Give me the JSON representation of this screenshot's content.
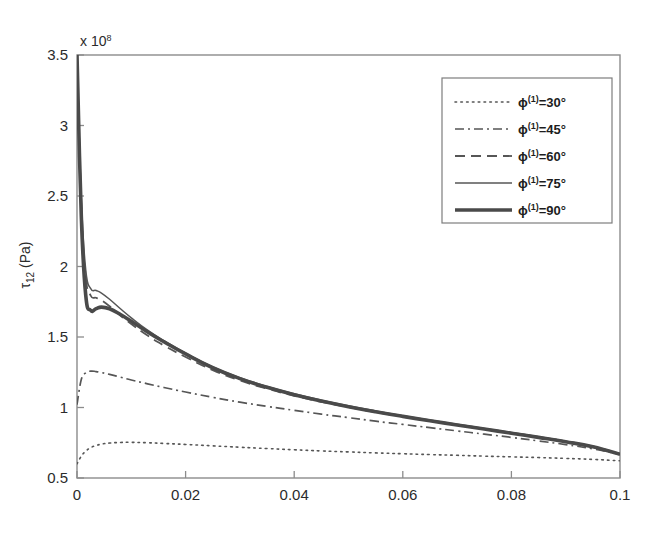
{
  "figure": {
    "exponent_label": "x 10",
    "exponent_value": "8",
    "y_axis_label_main": "τ",
    "y_axis_label_sub": "12",
    "y_axis_label_unit": " (Pa)"
  },
  "legend": {
    "position": "top-right",
    "entries": [
      {
        "label_sym": "ϕ",
        "label_sup": "(1)",
        "label_rest": "=30°",
        "style": "dotted",
        "angle": 30
      },
      {
        "label_sym": "ϕ",
        "label_sup": "(1)",
        "label_rest": "=45°",
        "style": "dash-dot",
        "angle": 45
      },
      {
        "label_sym": "ϕ",
        "label_sup": "(1)",
        "label_rest": "=60°",
        "style": "dashed",
        "angle": 60
      },
      {
        "label_sym": "ϕ",
        "label_sup": "(1)",
        "label_rest": "=75°",
        "style": "solid-thin",
        "angle": 75
      },
      {
        "label_sym": "ϕ",
        "label_sup": "(1)",
        "label_rest": "=90°",
        "style": "solid-thick",
        "angle": 90
      }
    ]
  },
  "chart_data": {
    "type": "line",
    "title": "",
    "xlabel": "",
    "ylabel": "τ_12 (Pa)",
    "y_exponent": 8,
    "y_exponent_text": "x 10^8",
    "xlim": [
      0,
      0.1
    ],
    "ylim": [
      0.5,
      3.5
    ],
    "xticks": [
      0,
      0.02,
      0.04,
      0.06,
      0.08,
      0.1
    ],
    "xtick_labels": [
      "0",
      "0.02",
      "0.04",
      "0.06",
      "0.08",
      "0.1"
    ],
    "yticks": [
      0.5,
      1,
      1.5,
      2,
      2.5,
      3,
      3.5
    ],
    "ytick_labels": [
      "0.5",
      "1",
      "1.5",
      "2",
      "2.5",
      "3",
      "3.5"
    ],
    "grid": false,
    "legend_position": "upper right",
    "x": [
      0,
      0.0008,
      0.0016,
      0.0025,
      0.0035,
      0.0045,
      0.006,
      0.008,
      0.01,
      0.013,
      0.016,
      0.02,
      0.025,
      0.03,
      0.035,
      0.04,
      0.045,
      0.05,
      0.055,
      0.06,
      0.065,
      0.07,
      0.075,
      0.08,
      0.085,
      0.09,
      0.095,
      0.1
    ],
    "series": [
      {
        "name": "ϕ(1)=30°",
        "style": "dotted",
        "values": [
          0.6,
          0.655,
          0.69,
          0.715,
          0.73,
          0.74,
          0.748,
          0.752,
          0.753,
          0.75,
          0.745,
          0.738,
          0.728,
          0.718,
          0.709,
          0.7,
          0.692,
          0.685,
          0.678,
          0.672,
          0.666,
          0.661,
          0.655,
          0.65,
          0.645,
          0.639,
          0.632,
          0.622
        ]
      },
      {
        "name": "ϕ(1)=45°",
        "style": "dash-dot",
        "values": [
          1.02,
          1.2,
          1.245,
          1.258,
          1.255,
          1.248,
          1.235,
          1.215,
          1.195,
          1.168,
          1.142,
          1.11,
          1.072,
          1.038,
          1.008,
          0.98,
          0.953,
          0.928,
          0.903,
          0.88,
          0.857,
          0.834,
          0.811,
          0.788,
          0.763,
          0.737,
          0.707,
          0.668
        ]
      },
      {
        "name": "ϕ(1)=60°",
        "style": "dashed",
        "values": [
          3.5,
          2.42,
          1.93,
          1.795,
          1.778,
          1.76,
          1.718,
          1.652,
          1.592,
          1.51,
          1.44,
          1.358,
          1.265,
          1.192,
          1.133,
          1.083,
          1.04,
          1.002,
          0.967,
          0.935,
          0.905,
          0.876,
          0.848,
          0.82,
          0.791,
          0.76,
          0.724,
          0.672
        ]
      },
      {
        "name": "ϕ(1)=75°",
        "style": "solid-thin",
        "values": [
          3.5,
          2.48,
          1.98,
          1.845,
          1.83,
          1.812,
          1.768,
          1.7,
          1.636,
          1.548,
          1.474,
          1.386,
          1.288,
          1.211,
          1.149,
          1.097,
          1.052,
          1.012,
          0.976,
          0.942,
          0.911,
          0.881,
          0.852,
          0.823,
          0.793,
          0.761,
          0.724,
          0.67
        ]
      },
      {
        "name": "ϕ(1)=90°",
        "style": "solid-thick",
        "values": [
          3.5,
          2.35,
          1.8,
          1.69,
          1.7,
          1.712,
          1.7,
          1.66,
          1.612,
          1.535,
          1.466,
          1.38,
          1.282,
          1.205,
          1.143,
          1.091,
          1.046,
          1.006,
          0.97,
          0.937,
          0.906,
          0.876,
          0.847,
          0.818,
          0.788,
          0.757,
          0.721,
          0.668
        ]
      }
    ]
  }
}
